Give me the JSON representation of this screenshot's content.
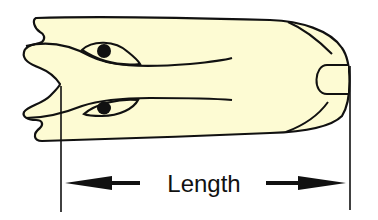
{
  "diagram": {
    "label": "Length",
    "colors": {
      "fill": "#fdfbd3",
      "stroke": "#111111",
      "background": "#ffffff"
    },
    "elements": [
      {
        "name": "body-outline",
        "type": "elongated shape with forked left end and rounded right end"
      },
      {
        "name": "upper-eye",
        "type": "oval with dark pupil"
      },
      {
        "name": "lower-eye",
        "type": "oval with dark pupil"
      },
      {
        "name": "tip-notch",
        "type": "rounded U-shape at right end"
      },
      {
        "name": "length-dimension",
        "type": "double arrow between two vertical extension lines"
      }
    ]
  }
}
